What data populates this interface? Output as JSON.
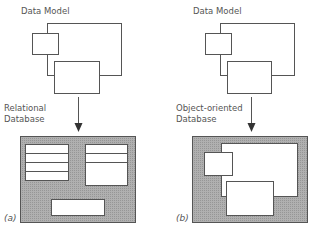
{
  "panels": [
    {
      "id": "a",
      "data_model_label": "Data Model",
      "database_label_line1": "Relational",
      "database_label_line2": "Database",
      "tag": "(a)"
    },
    {
      "id": "b",
      "data_model_label": "Data Model",
      "database_label_line1": "Object-oriented",
      "database_label_line2": "Database",
      "tag": "(b)"
    }
  ],
  "colors": {
    "line": "#555555",
    "database_fill": "#a9a9a9",
    "box_fill": "#ffffff"
  }
}
